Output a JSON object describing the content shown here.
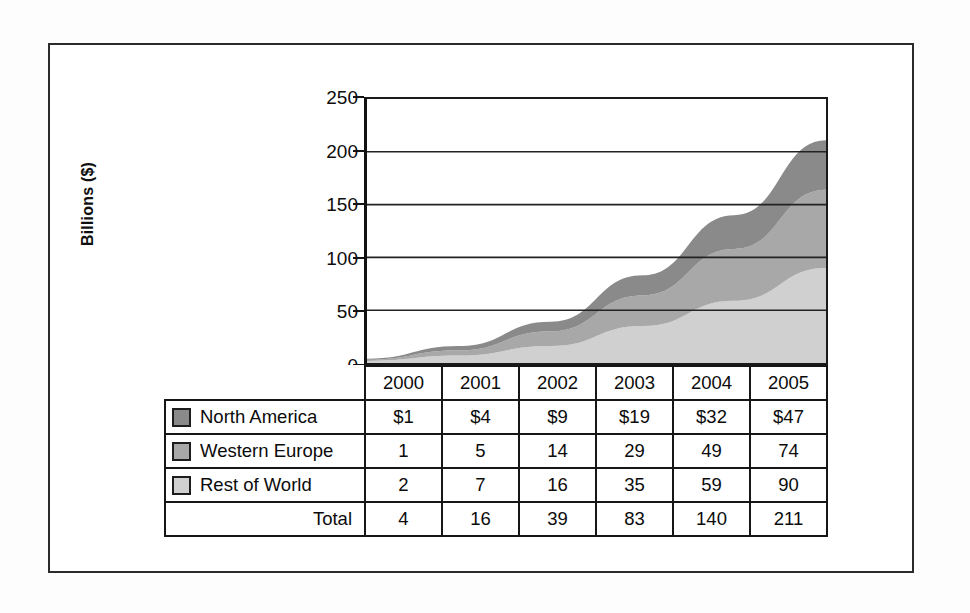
{
  "chart_data": {
    "type": "area",
    "stacked": true,
    "title": "",
    "xlabel": "",
    "ylabel": "Billions ($)",
    "categories": [
      "2000",
      "2001",
      "2002",
      "2003",
      "2004",
      "2005"
    ],
    "ylim": [
      0,
      250
    ],
    "yticks": [
      0,
      50,
      100,
      150,
      200,
      250
    ],
    "ytick_labels": [
      "0",
      "50",
      "100",
      "150",
      "200",
      "250"
    ],
    "grid": true,
    "legend_position": "table-left",
    "series": [
      {
        "name": "North America",
        "values": [
          1,
          4,
          9,
          19,
          32,
          47
        ],
        "display_values": [
          "$1",
          "$4",
          "$9",
          "$19",
          "$32",
          "$47"
        ],
        "color": "#8a8a8a",
        "stack_order": 3
      },
      {
        "name": "Western Europe",
        "values": [
          1,
          5,
          14,
          29,
          49,
          74
        ],
        "display_values": [
          "1",
          "5",
          "14",
          "29",
          "49",
          "74"
        ],
        "color": "#a8a8a8",
        "stack_order": 2
      },
      {
        "name": "Rest of World",
        "values": [
          2,
          7,
          16,
          35,
          59,
          90
        ],
        "display_values": [
          "2",
          "7",
          "16",
          "35",
          "59",
          "90"
        ],
        "color": "#d0d0d0",
        "stack_order": 1
      }
    ],
    "totals": {
      "name": "Total",
      "values": [
        4,
        16,
        39,
        83,
        140,
        211
      ],
      "display_values": [
        "4",
        "16",
        "39",
        "83",
        "140",
        "211"
      ]
    }
  },
  "table": {
    "corner_label": "",
    "column_headers": [
      "2000",
      "2001",
      "2002",
      "2003",
      "2004",
      "2005"
    ],
    "rows": [
      {
        "label": "North America",
        "swatch_color": "#8a8a8a",
        "has_swatch": true,
        "cells": [
          "$1",
          "$4",
          "$9",
          "$19",
          "$32",
          "$47"
        ]
      },
      {
        "label": "Western Europe",
        "swatch_color": "#a8a8a8",
        "has_swatch": true,
        "cells": [
          "1",
          "5",
          "14",
          "29",
          "49",
          "74"
        ]
      },
      {
        "label": "Rest of World",
        "swatch_color": "#d0d0d0",
        "has_swatch": true,
        "cells": [
          "2",
          "7",
          "16",
          "35",
          "59",
          "90"
        ]
      },
      {
        "label": "Total",
        "swatch_color": "",
        "has_swatch": false,
        "cells": [
          "4",
          "16",
          "39",
          "83",
          "140",
          "211"
        ]
      }
    ]
  },
  "colors": {
    "north_america": "#8a8a8a",
    "western_europe": "#a8a8a8",
    "rest_of_world": "#d0d0d0",
    "axis": "#141414",
    "gridline": "#222222",
    "frame": "#2b2b2b",
    "page_background": "#fdfdfd",
    "plot_background": "#ffffff"
  }
}
